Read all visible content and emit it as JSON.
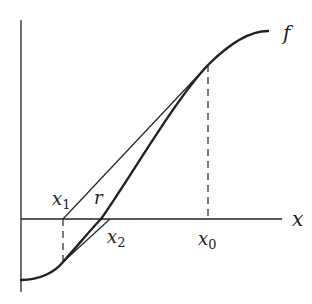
{
  "diagram": {
    "labels": {
      "function": "f",
      "x_axis": "x",
      "x0": {
        "base": "x",
        "sub": "0"
      },
      "x1": {
        "base": "x",
        "sub": "1"
      },
      "x2": {
        "base": "x",
        "sub": "2"
      },
      "root": "r"
    },
    "colors": {
      "stroke": "#222222",
      "background": "#ffffff"
    }
  }
}
